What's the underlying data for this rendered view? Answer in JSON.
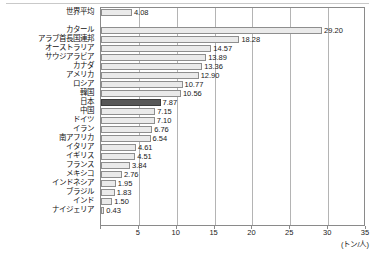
{
  "chart_data": {
    "type": "bar",
    "orientation": "horizontal",
    "title": "",
    "subtitle": "",
    "xlabel": "(トン/人)",
    "ylabel": "",
    "unit": "トン/人",
    "xlim": [
      0,
      35
    ],
    "xticks": [
      "0",
      "5",
      "10",
      "15",
      "20",
      "25",
      "30",
      "35"
    ],
    "xtick_values": [
      0,
      5,
      10,
      15,
      20,
      25,
      30,
      35
    ],
    "grid": true,
    "grid_axis": "x",
    "legend": "none",
    "highlight_category": "日本",
    "colors": {
      "bar_fill": "#eaeaea",
      "bar_border": "#8e8e8e",
      "highlight_fill": "#585858",
      "highlight_border": "#3d3d3d",
      "gridline": "#b4b4b4",
      "axis": "#8a8a8a",
      "text": "#111111"
    },
    "categories": [
      "世界平均",
      "カタール",
      "アラブ首長国連邦",
      "オーストラリア",
      "サウジアラビア",
      "カナダ",
      "アメリカ",
      "ロシア",
      "韓国",
      "日本",
      "中国",
      "ドイツ",
      "イラン",
      "南アフリカ",
      "イタリア",
      "イギリス",
      "フランス",
      "メキシコ",
      "インドネシア",
      "ブラジル",
      "インド",
      "ナイジェリア"
    ],
    "values": [
      4.08,
      29.2,
      18.28,
      14.57,
      13.89,
      13.36,
      12.9,
      10.77,
      10.56,
      7.87,
      7.15,
      7.1,
      6.76,
      6.54,
      4.61,
      4.51,
      3.84,
      2.76,
      1.95,
      1.83,
      1.5,
      0.43
    ],
    "value_labels": [
      "4.08",
      "29.20",
      "18.28",
      "14.57",
      "13.89",
      "13.36",
      "12.90",
      "10.77",
      "10.56",
      "7.87",
      "7.15",
      "7.10",
      "6.76",
      "6.54",
      "4.61",
      "4.51",
      "3.84",
      "2.76",
      "1.95",
      "1.83",
      "1.50",
      "0.43"
    ],
    "separator_after_index": 0
  }
}
